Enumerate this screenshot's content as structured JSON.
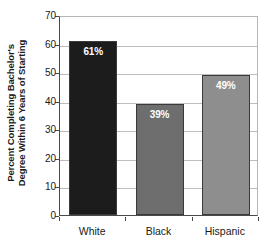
{
  "chart_data": {
    "type": "bar",
    "title": "",
    "subtitle": "",
    "categories": [
      "White",
      "Black",
      "Hispanic"
    ],
    "values": [
      61,
      39,
      49
    ],
    "data_labels": [
      "61%",
      "39%",
      "49%"
    ],
    "series": [
      {
        "name": "Percent Completing Bachelor's Degree Within 6 Years of Starting",
        "values": [
          61,
          39,
          49
        ]
      }
    ],
    "xlabel": "",
    "ylabel_line1": "Percent Completing Bachelor's",
    "ylabel_line2": "Degree Within 6 Years of Starting",
    "ylim": [
      0,
      70
    ],
    "ytick_labels": [
      "0",
      "10",
      "20",
      "30",
      "40",
      "50",
      "60",
      "70"
    ],
    "ytick_values": [
      0,
      10,
      20,
      30,
      40,
      50,
      60,
      70
    ],
    "grid": true,
    "grid_axis": "y",
    "legend": false,
    "legend_position": "none",
    "bar_colors": [
      "#1c1c1c",
      "#6e6e6e",
      "#8e8e8e"
    ],
    "bar_edge_color": "#3a3a3a",
    "data_label_color": "#ffffff",
    "plot_background": "#ffffff",
    "gridline_color": "#bdbdbd",
    "axis_color": "#4a4a4a"
  }
}
